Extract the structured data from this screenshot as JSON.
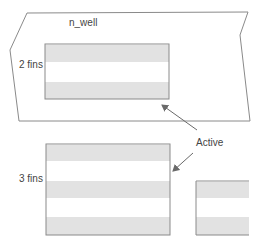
{
  "diagram": {
    "colors": {
      "outline": "#8a8a8a",
      "stripe": "#e2e2e2",
      "background": "#ffffff",
      "text": "#444444",
      "arrow": "#6a6a6a"
    },
    "labels": {
      "well": "n_well",
      "two_fins": "2 fins",
      "three_fins": "3 fins",
      "active": "Active"
    },
    "well_region": {
      "name": "n_well",
      "points": "27,13 248,12 240,35 250,121 19,121 10,50"
    },
    "active_regions": [
      {
        "name": "active-2-fins",
        "x": 45,
        "y": 44,
        "w": 124,
        "h": 55,
        "fins": 2,
        "stripes": [
          {
            "y": 45,
            "h": 17
          },
          {
            "y": 82,
            "h": 17
          }
        ]
      },
      {
        "name": "active-3-fins",
        "x": 46,
        "y": 144,
        "w": 124,
        "h": 91,
        "fins": 3,
        "stripes": [
          {
            "y": 145,
            "h": 16
          },
          {
            "y": 181,
            "h": 17
          },
          {
            "y": 217,
            "h": 18
          }
        ]
      },
      {
        "name": "active-partial",
        "x": 196,
        "y": 181,
        "w": 53,
        "h": 54,
        "stripes": [
          {
            "y": 182,
            "h": 16
          },
          {
            "y": 217,
            "h": 18
          }
        ]
      }
    ],
    "arrows": [
      {
        "name": "arrow-to-2-fin-active",
        "x1": 197,
        "y1": 130,
        "x2": 162,
        "y2": 105
      },
      {
        "name": "arrow-to-3-fin-active",
        "x1": 193,
        "y1": 153,
        "x2": 173,
        "y2": 171
      }
    ]
  }
}
